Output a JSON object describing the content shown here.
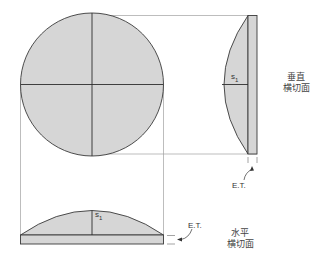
{
  "diagram": {
    "type": "lens cross-section projection",
    "colors": {
      "fill": "#d6d6d6",
      "stroke": "#3a3a3a",
      "projection": "#9a9a9a",
      "background": "#ffffff"
    },
    "front_view": {
      "shape": "circle",
      "crosshair": true
    },
    "vertical_section": {
      "label_line1": "垂直",
      "label_line2": "横切面",
      "sag_label": "s",
      "sag_sub": "1",
      "edge_label": "E.T."
    },
    "horizontal_section": {
      "label_line1": "水平",
      "label_line2": "横切面",
      "sag_label": "s",
      "sag_sub": "1",
      "edge_label": "E.T."
    }
  }
}
